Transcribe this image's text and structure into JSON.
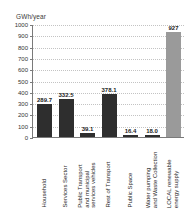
{
  "chart_data": {
    "type": "bar",
    "title": "",
    "xlabel": "",
    "ylabel": "GWh/year",
    "ylim": [
      0,
      1000
    ],
    "ytick_labels": [
      "1000",
      "900",
      "800",
      "700",
      "600",
      "500",
      "400",
      "300",
      "200",
      "100",
      "0"
    ],
    "ytick_values": [
      1000,
      900,
      800,
      700,
      600,
      500,
      400,
      300,
      200,
      100,
      0
    ],
    "grid": true,
    "legend": "none",
    "categories": [
      "Household",
      "Services Sector",
      "Public Transport and municipal services vehicles",
      "Rest of Transport",
      "Public Space",
      "Water pumping and Waste Collection",
      "LOCAL renewable energy supply"
    ],
    "category_lines": [
      [
        "Household"
      ],
      [
        "Services Sector"
      ],
      [
        "Public Transport",
        "and municipal",
        "services vehicles"
      ],
      [
        "Rest of Transport"
      ],
      [
        "Public Space"
      ],
      [
        "Water pumping",
        "and Waste Collection"
      ],
      [
        "LOCAL renewable",
        "energy supply"
      ]
    ],
    "values": [
      289.7,
      332.5,
      39.1,
      378.1,
      16.4,
      18.0,
      927
    ],
    "value_labels": [
      "289.7",
      "332.5",
      "39.1",
      "378.1",
      "16.4",
      "18.0",
      "927"
    ],
    "bar_colors": [
      "#2e2e2e",
      "#2e2e2e",
      "#2e2e2e",
      "#2e2e2e",
      "#2e2e2e",
      "#2e2e2e",
      "#9a9a9a"
    ],
    "accent_index": 6,
    "colors": {
      "bar_dark": "#2e2e2e",
      "bar_accent": "#9a9a9a",
      "axis": "#7a7a7a",
      "grid": "#c3c3c3",
      "text": "#262626",
      "background": "#ffffff"
    }
  }
}
